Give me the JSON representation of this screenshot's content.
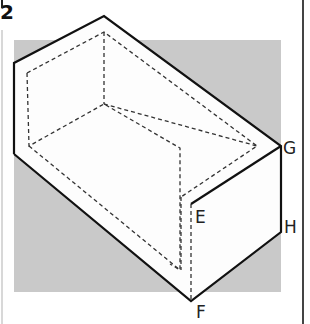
{
  "figure": {
    "number": "2",
    "background_color": "#c8c8c8",
    "line_color": "#111111",
    "labels": {
      "G": "G",
      "E": "E",
      "H": "H",
      "F": "F"
    }
  }
}
